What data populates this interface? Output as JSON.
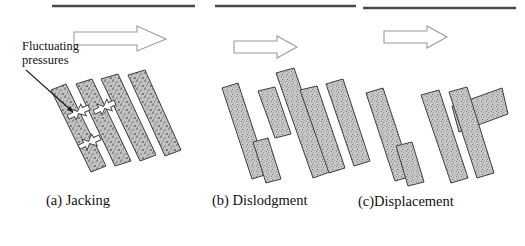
{
  "figure": {
    "type": "diagram",
    "background_color": "#ffffff",
    "line_color": "#444444",
    "block_fill": "#b9b9b9",
    "block_stroke": "#3a3a3a",
    "arrow_stroke": "#8a8a8a"
  },
  "annotations": {
    "fluctuating_pressure_label_line1": "Fluctuating",
    "fluctuating_pressure_label_line2": "pressures"
  },
  "panels": [
    {
      "id": "a",
      "caption": "(a) Jacking",
      "description": "Four parallel inclined blocks remain in place; white bidirectional arrows in the joints show fluctuating pressure jacking the blocks apart.",
      "flow_arrow": "right",
      "surface_line": true,
      "block_count": 4,
      "jacking_symbols": 3
    },
    {
      "id": "b",
      "caption": "(b) Dislodgment",
      "description": "Blocks have broken apart; two of the columns are split into offset upper and lower fragments with open gaps.",
      "flow_arrow": "right",
      "surface_line": true,
      "block_count": 6,
      "jacking_symbols": 0
    },
    {
      "id": "c",
      "caption": "(c)Displacement",
      "description": "One fragment has been fully ejected from the rock mass and rotated to a near-horizontal attitude above the remaining blocks.",
      "flow_arrow": "right",
      "surface_line": true,
      "block_count": 5,
      "jacking_symbols": 0,
      "ejected_block": true
    }
  ],
  "surface_lines": [
    {
      "x1": 52,
      "y1": 6,
      "x2": 195,
      "y2": 6
    },
    {
      "x1": 215,
      "y1": 6,
      "x2": 356,
      "y2": 6
    },
    {
      "x1": 363,
      "y1": 8,
      "x2": 516,
      "y2": 8
    }
  ],
  "flow_arrows": [
    {
      "panel": "a",
      "x": 74,
      "y": 26,
      "w": 92,
      "h": 25
    },
    {
      "panel": "b",
      "x": 234,
      "y": 36,
      "w": 62,
      "h": 22
    },
    {
      "panel": "c",
      "x": 384,
      "y": 26,
      "w": 62,
      "h": 22
    }
  ]
}
